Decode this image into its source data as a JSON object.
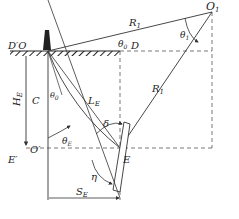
{
  "diagram": {
    "type": "geometry",
    "labels": {
      "O1": "O",
      "O1_sub": "1",
      "D_prime_O": "D′O",
      "D": "D",
      "theta0_top": "θ",
      "theta0_top_sub": "0",
      "theta1": "θ",
      "theta1_sub": "1",
      "R1_top": "R",
      "R1_top_sub": "1",
      "R1_diag": "R",
      "R1_diag_sub": "1",
      "C": "C",
      "theta0_left": "θ",
      "theta0_left_sub": "0",
      "LE": "L",
      "LE_sub": "E",
      "HE": "H",
      "HE_sub": "E",
      "delta": "δ",
      "thetaE": "θ",
      "thetaE_sub": "E",
      "O_prime": "O′",
      "E_prime": "E′",
      "E": "E",
      "eta": "η",
      "SE": "S",
      "SE_sub": "E"
    },
    "colors": {
      "line": "#333333",
      "dash": "#555555",
      "ground": "#222222"
    }
  }
}
